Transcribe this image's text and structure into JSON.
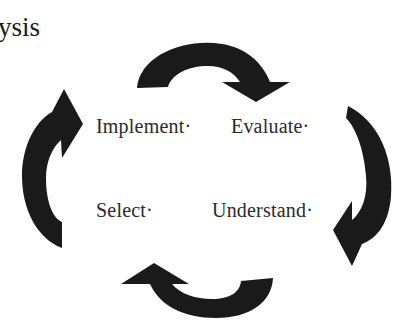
{
  "heading": {
    "text": "ysis"
  },
  "cycle": {
    "stages": [
      {
        "id": "implement",
        "label": "Implement·"
      },
      {
        "id": "evaluate",
        "label": "Evaluate·"
      },
      {
        "id": "select",
        "label": "Select·"
      },
      {
        "id": "understand",
        "label": "Understand·"
      }
    ],
    "arrows": [
      {
        "id": "top",
        "icon": "curved-arrow-right-icon",
        "direction": "clockwise"
      },
      {
        "id": "right",
        "icon": "curved-arrow-down-icon",
        "direction": "clockwise"
      },
      {
        "id": "bottom",
        "icon": "curved-arrow-left-icon",
        "direction": "clockwise"
      },
      {
        "id": "left",
        "icon": "curved-arrow-up-icon",
        "direction": "clockwise"
      }
    ],
    "arrow_color": "#1a1a1a"
  }
}
